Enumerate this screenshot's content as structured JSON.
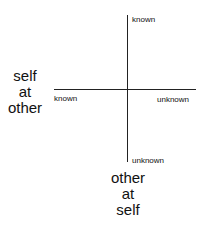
{
  "diagram": {
    "vertical_axis": {
      "top_label": "known",
      "bottom_label": "unknown",
      "title": [
        "other",
        "at",
        "self"
      ]
    },
    "horizontal_axis": {
      "left_label": "known",
      "right_label": "unknown",
      "title": [
        "self",
        "at",
        "other"
      ]
    }
  }
}
